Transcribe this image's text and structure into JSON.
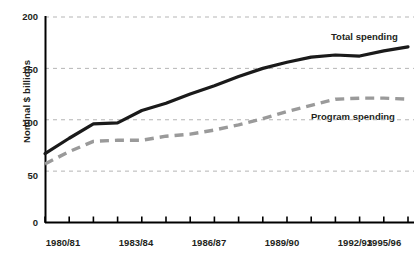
{
  "chart_data": {
    "type": "line",
    "title": "",
    "xlabel": "",
    "ylabel": "Nominal $ billions",
    "ylim": [
      0,
      200
    ],
    "yticks": [
      0,
      50,
      100,
      150,
      200
    ],
    "grid": true,
    "gridlines_at": [
      50,
      100,
      150,
      200
    ],
    "legend_position": "inline-right",
    "x": [
      "1980/81",
      "1981/82",
      "1982/83",
      "1983/84",
      "1984/85",
      "1985/86",
      "1986/87",
      "1987/88",
      "1988/89",
      "1989/90",
      "1990/91",
      "1991/92",
      "1992/93",
      "1993/94",
      "1994/95",
      "1995/96"
    ],
    "xtick_labels_shown": [
      "1980/81",
      "1983/84",
      "1986/87",
      "1989/90",
      "1992/93",
      "1995/96"
    ],
    "series": [
      {
        "name": "Total spending",
        "style": "solid",
        "color": "#1a1a1a",
        "values": [
          67,
          82,
          96,
          97,
          109,
          116,
          125,
          133,
          142,
          150,
          156,
          161,
          163,
          162,
          167,
          171
        ]
      },
      {
        "name": "Program spending",
        "style": "dashed",
        "color": "#9a9a9a",
        "values": [
          57,
          69,
          79,
          80,
          80,
          84,
          86,
          90,
          95,
          101,
          108,
          114,
          120,
          121,
          121,
          120
        ]
      }
    ],
    "annotations": [
      {
        "text": "Total spending",
        "x_index": 13,
        "y_value": 185
      },
      {
        "text": "Program spending",
        "x_index": 12,
        "y_value": 103
      }
    ]
  },
  "axis": {
    "y_tick_labels": [
      "0",
      "50",
      "100",
      "150",
      "200"
    ],
    "x_tick_labels": [
      "1980/81",
      "1983/84",
      "1986/87",
      "1989/90",
      "1992/93",
      "1995/96"
    ],
    "y_axis_title": "Nominal $ billions"
  },
  "labels": {
    "total_spending": "Total spending",
    "program_spending": "Program spending"
  },
  "colors": {
    "total_line": "#1a1a1a",
    "program_line": "#9a9a9a",
    "grid": "#b5b5b5",
    "axis": "#000000",
    "text": "#231f20",
    "background": "#ffffff"
  }
}
